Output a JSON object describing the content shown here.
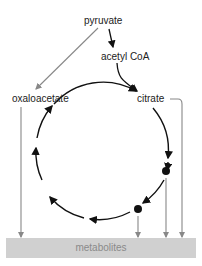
{
  "diagram": {
    "nodes": {
      "pyruvate": "pyruvate",
      "acetyl_coa": "acetyl CoA",
      "oxaloacetate": "oxaloacetate",
      "citrate": "citrate",
      "metabolites": "metabolites"
    },
    "colors": {
      "cycle_arrow": "#111111",
      "side_arrow": "#888888",
      "metabolites_bar": "#d0d0d0",
      "metabolites_text": "#8a8a8a"
    }
  }
}
